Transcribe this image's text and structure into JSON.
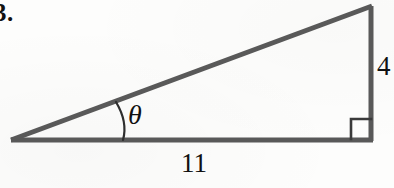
{
  "figure": {
    "problem_number": "3.",
    "type": "right-triangle-trigonometry-diagram",
    "stroke_color": "#595959",
    "text_color": "#111111",
    "background_color": "#fdfdfc",
    "labels": {
      "angle_symbol": "θ",
      "base_length": "11",
      "opposite_length": "4"
    },
    "geometry": {
      "left_vertex": [
        11,
        140
      ],
      "right_angle_vertex": [
        372,
        140
      ],
      "apex_vertex": [
        372,
        6
      ],
      "base_label_position": [
        193,
        163
      ],
      "opposite_label_position": [
        382,
        67
      ],
      "theta_label_position": [
        137,
        115
      ],
      "right_angle_marker_size": 20,
      "angle_arc_radius": 46
    },
    "measurements": {
      "adjacent_side": 11,
      "opposite_side": 4,
      "right_angle_degrees": 90
    }
  }
}
